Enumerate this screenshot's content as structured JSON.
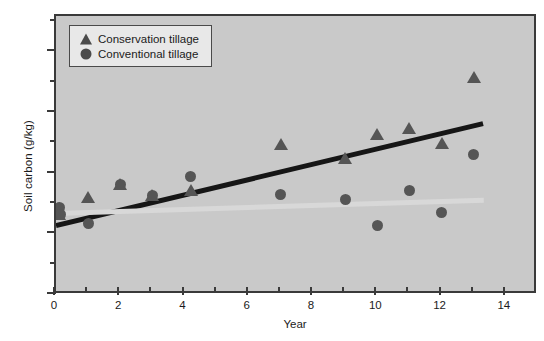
{
  "chart_data": {
    "type": "scatter",
    "title": "",
    "xlabel": "Year",
    "ylabel": "Soil carbon (g/kg)",
    "xlim": [
      0,
      15
    ],
    "ylim": [
      0,
      23
    ],
    "xticks": [
      0,
      2,
      4,
      6,
      8,
      10,
      12,
      14
    ],
    "xtick_labels": [
      "0",
      "2",
      "4",
      "6",
      "8",
      "10",
      "12",
      "14"
    ],
    "xminor_ticks": [
      1,
      3,
      5,
      7,
      9,
      11,
      13
    ],
    "yticks": [
      0,
      5,
      10,
      15,
      20
    ],
    "ytick_labels": [
      "0",
      "5",
      "10",
      "15",
      "20"
    ],
    "yminor_ticks": [
      2.5,
      7.5,
      12.5,
      17.5,
      22.5
    ],
    "grid": false,
    "legend_position": "upper-left",
    "plot_background": "#c9c9c9",
    "marker_color": "#555555",
    "series": [
      {
        "name": "Conservation tillage",
        "marker": "triangle",
        "color": "#555555",
        "points": [
          [
            0.1,
            6.5
          ],
          [
            1.0,
            7.9
          ],
          [
            2.0,
            9.0
          ],
          [
            3.0,
            8.1
          ],
          [
            4.2,
            8.5
          ],
          [
            7.0,
            12.3
          ],
          [
            9.0,
            11.1
          ],
          [
            10.0,
            13.1
          ],
          [
            11.0,
            13.6
          ],
          [
            12.0,
            12.4
          ],
          [
            13.0,
            17.8
          ]
        ],
        "trendline": {
          "color": "#161616",
          "x_start": 0.0,
          "y_start": 5.7,
          "x_end": 13.3,
          "y_end": 14.1
        }
      },
      {
        "name": "Conventional tillage",
        "marker": "circle",
        "color": "#555555",
        "points": [
          [
            0.1,
            7.2
          ],
          [
            0.15,
            6.6
          ],
          [
            1.0,
            5.9
          ],
          [
            2.0,
            9.1
          ],
          [
            3.0,
            8.2
          ],
          [
            4.2,
            9.8
          ],
          [
            7.0,
            8.3
          ],
          [
            9.0,
            7.9
          ],
          [
            10.0,
            5.7
          ],
          [
            11.0,
            8.6
          ],
          [
            12.0,
            6.8
          ],
          [
            13.0,
            11.6
          ]
        ],
        "trendline": {
          "color": "#d8d8d8",
          "x_start": 0.0,
          "y_start": 6.7,
          "x_end": 13.3,
          "y_end": 7.8
        }
      }
    ]
  },
  "legend": {
    "items": [
      {
        "label": "Conservation tillage",
        "marker": "triangle"
      },
      {
        "label": "Conventional tillage",
        "marker": "circle"
      }
    ]
  },
  "axes": {
    "x_title": "Year",
    "y_title": "Soil carbon (g/kg)"
  }
}
